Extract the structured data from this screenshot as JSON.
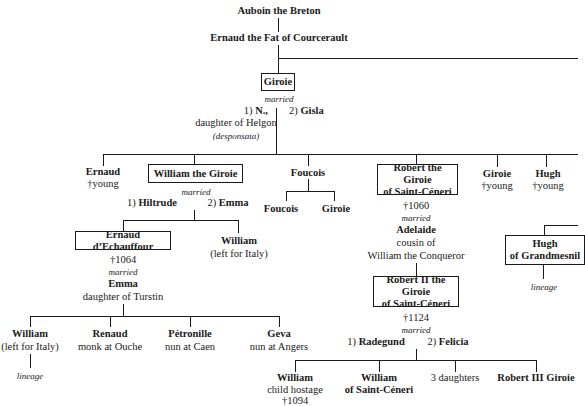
{
  "tree": {
    "root": "Auboin the Breton",
    "gen1": "Ernaud the Fat of Courcerault",
    "giroie": {
      "name": "Giroie",
      "married": "married",
      "spouse1_num": "1)",
      "spouse1": "N.,",
      "spouse1_note": "daughter of Helgon",
      "spouse1_note2": "(desponsata)",
      "spouse2_num": "2)",
      "spouse2": "Gisla"
    },
    "children": {
      "ernaud": {
        "name": "Ernaud",
        "note": "†young"
      },
      "william": {
        "name": "William the Giroie",
        "married": "married",
        "spouse1_num": "1)",
        "spouse1": "Hiltrude",
        "spouse2_num": "2)",
        "spouse2": "Emma"
      },
      "foucois": {
        "name": "Foucois",
        "child1": "Foucois",
        "child2": "Giroie"
      },
      "robert": {
        "line1": "Robert the Giroie",
        "line2": "of Saint-Céneri",
        "death": "†1060",
        "married": "married",
        "spouse": "Adelaide",
        "spouse_note1": "cousin of",
        "spouse_note2": "William the Conqueror"
      },
      "giroie": {
        "name": "Giroie",
        "note": "†young"
      },
      "hugh": {
        "name": "Hugh",
        "note": "†young"
      }
    },
    "ernaud_dechauffour": {
      "name": "Ernaud d’Echauffour",
      "death": "†1064",
      "married": "married",
      "spouse": "Emma",
      "spouse_note": "daughter of Turstin"
    },
    "william_italy": {
      "name": "William",
      "note": "(left for Italy)"
    },
    "hugh_grandmesnil": {
      "line1": "Hugh",
      "line2": "of Grandmesnil",
      "lineage": "lineage"
    },
    "ernaud_children": [
      {
        "name": "William",
        "note": "(left for Italy)",
        "lineage": "lineage"
      },
      {
        "name": "Renaud",
        "note": "monk at Ouche"
      },
      {
        "name": "Pétronille",
        "note": "nun at Caen"
      },
      {
        "name": "Geva",
        "note": "nun at Angers"
      }
    ],
    "robert2": {
      "line1": "Robert II the Giroie",
      "line2": "of Saint-Céneri",
      "death": "†1124",
      "married": "married",
      "spouse1_num": "1)",
      "spouse1": "Radegund",
      "spouse2_num": "2)",
      "spouse2": "Felicia"
    },
    "robert2_children": [
      {
        "name": "William",
        "note1": "child hostage",
        "note2": "†1094"
      },
      {
        "line1": "William",
        "line2": "of Saint-Céneri"
      },
      {
        "name": "3 daughters"
      },
      {
        "name": "Robert III Giroie"
      }
    ]
  }
}
